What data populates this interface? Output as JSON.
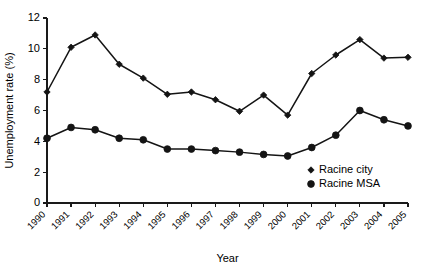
{
  "chart_data": {
    "type": "line",
    "title": "",
    "xlabel": "Year",
    "ylabel": "Unemployment rate (%)",
    "categories": [
      "1990",
      "1991",
      "1992",
      "1993",
      "1994",
      "1995",
      "1996",
      "1997",
      "1998",
      "1999",
      "2000",
      "2001",
      "2002",
      "2003",
      "2004",
      "2005"
    ],
    "x": [
      1990,
      1991,
      1992,
      1993,
      1994,
      1995,
      1996,
      1997,
      1998,
      1999,
      2000,
      2001,
      2002,
      2003,
      2004,
      2005
    ],
    "ylim": [
      0,
      12
    ],
    "yticks": [
      0,
      2,
      4,
      6,
      8,
      10,
      12
    ],
    "ytick_labels": [
      "0",
      "2",
      "4",
      "6",
      "8",
      "10",
      "12"
    ],
    "xlim": [
      1990,
      2005
    ],
    "grid": false,
    "legend_position": "inside-lower-right",
    "series": [
      {
        "name": "Racine city",
        "marker": "diamond",
        "color": "#141414",
        "values": [
          7.2,
          10.1,
          10.9,
          9.0,
          8.1,
          7.05,
          7.2,
          6.7,
          5.95,
          7.0,
          5.7,
          8.4,
          9.6,
          10.6,
          9.4,
          9.45
        ]
      },
      {
        "name": "Racine MSA",
        "marker": "circle",
        "color": "#141414",
        "values": [
          4.2,
          4.9,
          4.75,
          4.2,
          4.1,
          3.5,
          3.5,
          3.4,
          3.3,
          3.15,
          3.05,
          3.6,
          4.4,
          6.0,
          5.4,
          5.0
        ]
      }
    ]
  },
  "legend": {
    "items": [
      {
        "label": "Racine city",
        "marker": "diamond"
      },
      {
        "label": "Racine MSA",
        "marker": "circle"
      }
    ]
  }
}
